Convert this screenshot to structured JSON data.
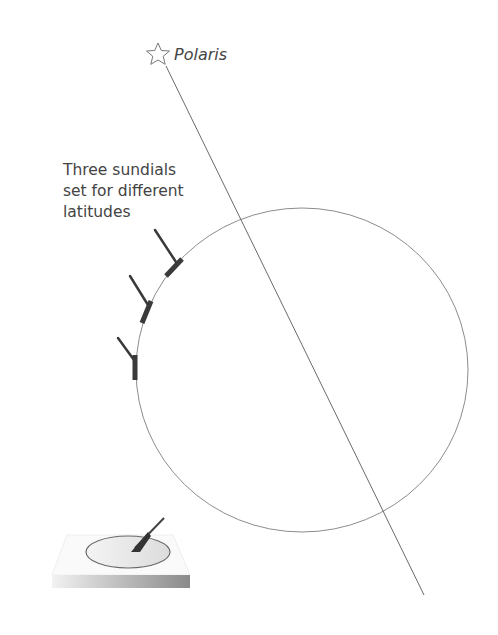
{
  "star": {
    "label": "Polaris",
    "icon": "star-outline"
  },
  "caption": {
    "lines": [
      "Three sundials",
      "set for different",
      "latitudes"
    ]
  },
  "colors": {
    "line": "#666666",
    "earth_outline": "#888888",
    "sundial": "#3a3a3a",
    "text": "#444444"
  },
  "geometry": {
    "axis_line": {
      "x1": 166,
      "y1": 66,
      "x2": 424,
      "y2": 595
    },
    "earth": {
      "cx": 302,
      "cy": 370,
      "rx": 166,
      "ry": 162
    },
    "sundials_on_earth": 3
  }
}
